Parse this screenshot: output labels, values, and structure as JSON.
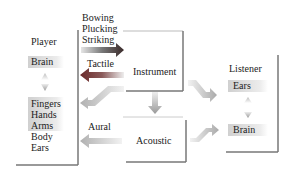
{
  "player": {
    "title": "Player",
    "brain": "Brain",
    "effectors": [
      "Fingers",
      "Hands",
      "Arms",
      "Body",
      "Ears"
    ]
  },
  "instrument": {
    "title": "Instrument"
  },
  "acoustic": {
    "title": "Acoustic"
  },
  "listener": {
    "title": "Listener",
    "ears": "Ears",
    "brain": "Brain"
  },
  "arrows": {
    "excitation": [
      "Bowing",
      "Plucking",
      "Striking"
    ],
    "tactile": "Tactile",
    "aural": "Aural"
  },
  "colors": {
    "arrow_dark": "#4a4a4a",
    "arrow_red": "#8a2a2a",
    "arrow_light": "#b8b8b8",
    "box_edge": "#777777"
  }
}
